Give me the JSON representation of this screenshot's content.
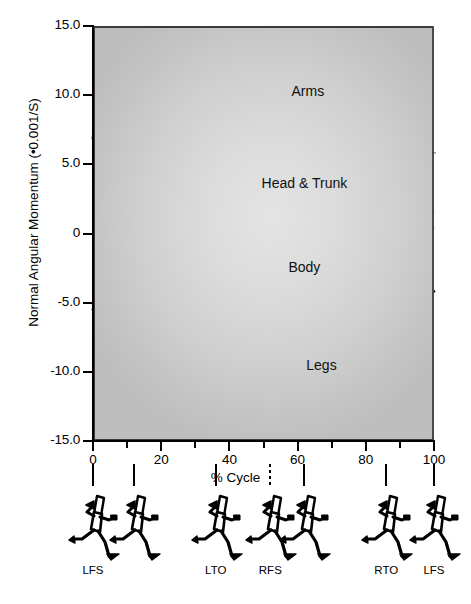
{
  "chart_data": {
    "type": "line",
    "title": "",
    "xlabel": "% Cycle",
    "ylabel": "Normal Angular Momentum (•0.001/S)",
    "xlim": [
      0,
      100
    ],
    "ylim": [
      -15.0,
      15.0
    ],
    "grid": false,
    "legend_position": "inline-annotations",
    "xticks": [
      0,
      20,
      40,
      60,
      80,
      100
    ],
    "xtick_labels": [
      "0",
      "20",
      "40",
      "60",
      "80",
      "100"
    ],
    "yticks": [
      15.0,
      10.0,
      5.0,
      0,
      -5.0,
      -10.0,
      -15.0
    ],
    "ytick_labels": [
      "15.0",
      "10.0",
      "5.0",
      "0",
      "-5.0",
      "-10.0",
      "-15.0"
    ],
    "x": [
      0,
      5,
      10,
      15,
      20,
      25,
      30,
      35,
      40,
      45,
      50,
      55,
      60,
      65,
      70,
      75,
      80,
      85,
      90,
      95,
      100
    ],
    "series": [
      {
        "name": "Arms",
        "style": "dashed",
        "color": "#111111",
        "label_text": "Arms",
        "values": [
          -5.4,
          -7.3,
          -8.7,
          -9.3,
          -9.2,
          -8.3,
          -6.6,
          -4.2,
          -1.3,
          1.9,
          5.0,
          7.3,
          8.6,
          9.0,
          8.8,
          7.8,
          6.0,
          3.3,
          0.3,
          -2.6,
          -4.3
        ]
      },
      {
        "name": "Legs",
        "style": "dashed",
        "color": "#7d7d7d",
        "label_text": "Legs",
        "values": [
          6.8,
          10.6,
          12.8,
          13.4,
          13.2,
          12.0,
          9.6,
          6.2,
          2.2,
          -2.0,
          -5.9,
          -9.0,
          -11.2,
          -12.5,
          -12.8,
          -12.0,
          -10.0,
          -6.6,
          -2.3,
          2.3,
          5.9
        ]
      },
      {
        "name": "Head & Trunk",
        "style": "solid",
        "color": "#8a8a8a",
        "label_text": "Head & Trunk",
        "values": [
          0.3,
          -0.6,
          -1.6,
          -2.2,
          -2.4,
          -2.4,
          -2.2,
          -1.8,
          -1.3,
          -0.7,
          0.1,
          0.9,
          1.7,
          2.2,
          2.5,
          2.5,
          2.3,
          1.9,
          1.4,
          0.8,
          0.3
        ]
      },
      {
        "name": "Body",
        "style": "solid",
        "color": "#000000",
        "label_text": "Body",
        "values": [
          1.5,
          1.8,
          2.0,
          2.1,
          2.0,
          1.7,
          1.2,
          0.5,
          -0.3,
          -0.8,
          -1.0,
          -1.1,
          -1.3,
          -1.5,
          -1.5,
          -1.2,
          -0.5,
          0.6,
          1.4,
          1.7,
          1.5
        ]
      }
    ],
    "annotations": [
      {
        "text": "Arms",
        "x": 63,
        "y": 10.2
      },
      {
        "text": "Head & Trunk",
        "x": 62,
        "y": 3.6
      },
      {
        "text": "Body",
        "x": 62,
        "y": -2.5
      },
      {
        "text": "Legs",
        "x": 67,
        "y": -9.6
      }
    ]
  },
  "gait_events": {
    "positions_pct": [
      0,
      12,
      36,
      52,
      62,
      86,
      100
    ],
    "dashed_index": 3,
    "labels": [
      "LFS",
      "",
      "LTO",
      "RFS",
      "",
      "RTO",
      "LFS"
    ],
    "figure_name": "runner-stick-figure"
  }
}
